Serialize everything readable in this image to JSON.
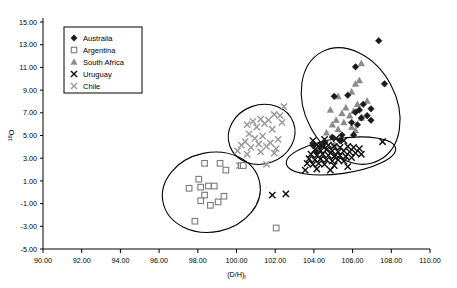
{
  "chart_data": {
    "type": "scatter",
    "title": "",
    "xlabel": "(D/H)i",
    "ylabel": "18O",
    "xlim": [
      90,
      110
    ],
    "ylim": [
      -5,
      15
    ],
    "xticks": [
      "90.00",
      "92.00",
      "94.00",
      "96.00",
      "98.00",
      "100.00",
      "102.00",
      "104.00",
      "106.00",
      "108.00",
      "110.00"
    ],
    "yticks": [
      "15.00",
      "13.00",
      "11.00",
      "9.00",
      "7.00",
      "5.00",
      "3.00",
      "1.00",
      "-1.00",
      "-3.00",
      "-5.00"
    ],
    "grid": false,
    "legend_position": "top-left",
    "legend_entries": [
      {
        "label": "Australia",
        "marker": "diamond",
        "color": "#1a1a1a"
      },
      {
        "label": "Argentina",
        "marker": "square",
        "color": "#7a7a7a"
      },
      {
        "label": "South Africa",
        "marker": "triangle",
        "color": "#8a8a8a"
      },
      {
        "label": "Uruguay",
        "marker": "cross",
        "color": "#111111"
      },
      {
        "label": "Chile",
        "marker": "cross",
        "color": "#9a9a9a"
      }
    ],
    "series": [
      {
        "name": "Australia",
        "marker": "diamond",
        "color": "#1a1a1a",
        "points": [
          [
            107.35,
            13.35
          ],
          [
            106.15,
            11.05
          ],
          [
            107.65,
            9.55
          ],
          [
            105.05,
            8.45
          ],
          [
            105.75,
            8.55
          ],
          [
            106.55,
            7.75
          ],
          [
            106.95,
            7.35
          ],
          [
            106.35,
            7.25
          ],
          [
            106.15,
            7.05
          ],
          [
            106.75,
            6.75
          ],
          [
            106.45,
            6.55
          ],
          [
            106.95,
            6.35
          ],
          [
            105.95,
            6.15
          ],
          [
            106.25,
            5.95
          ],
          [
            105.45,
            5.05
          ],
          [
            106.05,
            5.05
          ],
          [
            104.95,
            4.85
          ],
          [
            105.35,
            4.55
          ],
          [
            104.55,
            4.35
          ],
          [
            103.95,
            4.15
          ],
          [
            104.35,
            4.05
          ],
          [
            104.15,
            3.55
          ]
        ]
      },
      {
        "name": "Argentina",
        "marker": "square",
        "color": "#7a7a7a",
        "points": [
          [
            98.35,
            2.55
          ],
          [
            99.15,
            2.55
          ],
          [
            99.45,
            1.95
          ],
          [
            100.25,
            2.35
          ],
          [
            98.05,
            1.15
          ],
          [
            97.55,
            0.35
          ],
          [
            98.15,
            0.45
          ],
          [
            98.55,
            0.55
          ],
          [
            98.85,
            0.55
          ],
          [
            98.35,
            -0.25
          ],
          [
            99.35,
            -0.35
          ],
          [
            98.15,
            -0.75
          ],
          [
            99.05,
            -0.85
          ],
          [
            98.65,
            -1.15
          ],
          [
            97.85,
            -2.55
          ],
          [
            102.05,
            -3.15
          ],
          [
            100.35,
            2.35
          ]
        ]
      },
      {
        "name": "South Africa",
        "marker": "triangle",
        "color": "#8a8a8a",
        "points": [
          [
            106.45,
            11.35
          ],
          [
            106.35,
            9.85
          ],
          [
            106.15,
            9.55
          ],
          [
            105.95,
            8.85
          ],
          [
            105.25,
            8.45
          ],
          [
            106.75,
            8.05
          ],
          [
            106.25,
            7.75
          ],
          [
            105.65,
            7.45
          ],
          [
            104.85,
            7.25
          ],
          [
            106.05,
            7.15
          ],
          [
            105.45,
            6.95
          ],
          [
            105.85,
            6.75
          ],
          [
            106.45,
            6.55
          ],
          [
            105.15,
            6.35
          ],
          [
            105.55,
            6.15
          ],
          [
            104.95,
            5.95
          ],
          [
            105.95,
            5.75
          ],
          [
            105.25,
            5.55
          ],
          [
            106.15,
            5.45
          ],
          [
            104.65,
            5.25
          ],
          [
            104.45,
            4.35
          ],
          [
            105.05,
            4.25
          ]
        ]
      },
      {
        "name": "Uruguay",
        "marker": "cross",
        "color": "#111111",
        "points": [
          [
            103.95,
            4.55
          ],
          [
            104.55,
            4.65
          ],
          [
            105.15,
            4.75
          ],
          [
            105.55,
            4.55
          ],
          [
            104.15,
            4.15
          ],
          [
            104.45,
            4.05
          ],
          [
            104.75,
            4.15
          ],
          [
            105.05,
            4.05
          ],
          [
            105.35,
            3.95
          ],
          [
            105.75,
            4.05
          ],
          [
            106.05,
            3.95
          ],
          [
            106.35,
            3.85
          ],
          [
            104.05,
            3.75
          ],
          [
            104.35,
            3.65
          ],
          [
            104.65,
            3.75
          ],
          [
            104.95,
            3.65
          ],
          [
            105.25,
            3.55
          ],
          [
            105.55,
            3.65
          ],
          [
            105.85,
            3.55
          ],
          [
            106.15,
            3.45
          ],
          [
            103.85,
            3.35
          ],
          [
            104.15,
            3.25
          ],
          [
            104.45,
            3.35
          ],
          [
            104.75,
            3.25
          ],
          [
            105.05,
            3.15
          ],
          [
            105.35,
            3.25
          ],
          [
            105.65,
            3.15
          ],
          [
            105.95,
            3.05
          ],
          [
            106.45,
            3.35
          ],
          [
            103.75,
            2.95
          ],
          [
            104.05,
            2.85
          ],
          [
            104.35,
            2.95
          ],
          [
            104.65,
            2.85
          ],
          [
            104.95,
            2.75
          ],
          [
            105.25,
            2.85
          ],
          [
            105.55,
            2.75
          ],
          [
            103.65,
            2.55
          ],
          [
            103.95,
            2.45
          ],
          [
            104.25,
            2.55
          ],
          [
            104.55,
            2.45
          ],
          [
            105.05,
            2.35
          ],
          [
            105.75,
            2.25
          ],
          [
            104.15,
            2.05
          ],
          [
            104.85,
            1.95
          ],
          [
            107.55,
            4.45
          ],
          [
            101.85,
            -0.25
          ],
          [
            102.55,
            -0.15
          ],
          [
            103.55,
            1.95
          ]
        ]
      },
      {
        "name": "Chile",
        "marker": "cross",
        "color": "#9a9a9a",
        "points": [
          [
            102.45,
            7.55
          ],
          [
            101.95,
            6.85
          ],
          [
            102.25,
            6.75
          ],
          [
            101.25,
            6.45
          ],
          [
            101.65,
            6.35
          ],
          [
            100.85,
            6.25
          ],
          [
            102.35,
            6.15
          ],
          [
            101.45,
            6.05
          ],
          [
            100.55,
            5.95
          ],
          [
            101.05,
            5.75
          ],
          [
            101.85,
            5.55
          ],
          [
            100.65,
            5.15
          ],
          [
            101.35,
            4.95
          ],
          [
            100.95,
            4.75
          ],
          [
            102.15,
            4.65
          ],
          [
            100.45,
            4.45
          ],
          [
            101.75,
            4.35
          ],
          [
            101.15,
            4.25
          ],
          [
            100.25,
            4.15
          ],
          [
            101.55,
            4.05
          ],
          [
            100.75,
            3.95
          ],
          [
            102.05,
            3.85
          ],
          [
            100.05,
            3.65
          ],
          [
            101.25,
            3.55
          ],
          [
            101.95,
            3.45
          ],
          [
            100.55,
            3.35
          ],
          [
            101.55,
            2.45
          ],
          [
            100.15,
            2.35
          ]
        ]
      }
    ],
    "ellipses": [
      {
        "name": "australia-south-africa-ellipse",
        "cx": 105.9,
        "cy": 7.6,
        "rx": 2.35,
        "ry": 5.4,
        "rotation": -28
      },
      {
        "name": "chile-ellipse",
        "cx": 101.3,
        "cy": 5.1,
        "rx": 1.75,
        "ry": 2.6,
        "rotation": -20
      },
      {
        "name": "uruguay-ellipse",
        "cx": 105.4,
        "cy": 3.2,
        "rx": 2.85,
        "ry": 1.55,
        "rotation": -8
      },
      {
        "name": "argentina-ellipse",
        "cx": 98.7,
        "cy": 0.0,
        "rx": 2.55,
        "ry": 3.5,
        "rotation": -12
      }
    ]
  }
}
